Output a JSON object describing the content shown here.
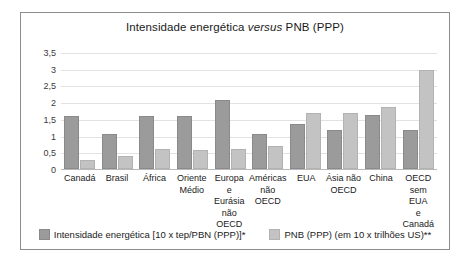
{
  "chart_data": {
    "type": "bar",
    "title": "Intensidade energética versus PNB (PPP)",
    "title_parts": {
      "before": "Intensidade energética ",
      "italic": "versus",
      "after": " PNB (PPP)"
    },
    "xlabel": "",
    "ylabel": "",
    "ylim": [
      0,
      3.5
    ],
    "yticks": [
      0,
      0.5,
      1,
      1.5,
      2,
      2.5,
      3,
      3.5
    ],
    "ytick_labels": [
      "0",
      "0,5",
      "1",
      "1,5",
      "2",
      "2,5",
      "3",
      "3,5"
    ],
    "grid": true,
    "legend_position": "bottom",
    "categories": [
      "Canadá",
      "Brasil",
      "África",
      "Oriente\nMédio",
      "Europa e\nEurásia\nnão\nOECD",
      "Américas\nnão\nOECD",
      "EUA",
      "Ásia não\nOECD",
      "China",
      "OECD\nsem EUA\ne Canadá"
    ],
    "series": [
      {
        "name": "Intensidade energética [10 x tep/PBN (PPP)]*",
        "color": "#9b9b9b",
        "values": [
          1.52,
          1.0,
          1.52,
          1.52,
          2.0,
          1.0,
          1.3,
          1.1,
          1.57,
          1.1
        ]
      },
      {
        "name": "PNB (PPP) (em 10 x trilhões US)**",
        "color": "#c3c3c3",
        "values": [
          0.2,
          0.33,
          0.55,
          0.5,
          0.53,
          0.63,
          1.63,
          1.63,
          1.8,
          2.9
        ]
      }
    ]
  }
}
